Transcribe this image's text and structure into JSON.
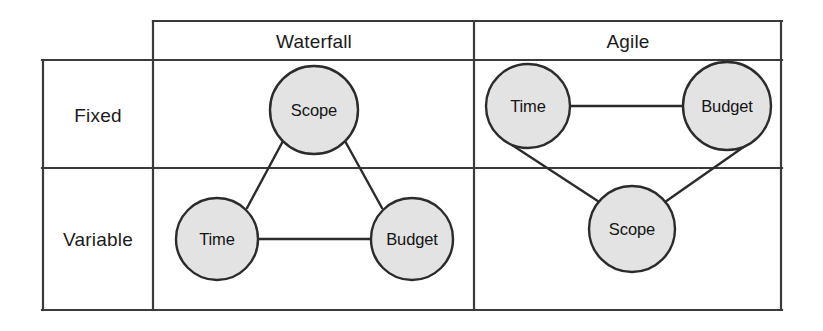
{
  "figure": {
    "name": "iron-triangle-waterfall-vs-agile-matrix",
    "type": "2x2-comparison-matrix-with-node-graphs"
  },
  "matrix": {
    "corner_cell": "",
    "column_headers": [
      {
        "id": "waterfall",
        "label": "Waterfall"
      },
      {
        "id": "agile",
        "label": "Agile"
      }
    ],
    "row_headers": [
      {
        "id": "fixed",
        "label": "Fixed"
      },
      {
        "id": "variable",
        "label": "Variable"
      }
    ]
  },
  "panels": [
    {
      "id": "waterfall",
      "header": "Waterfall",
      "fixed_nodes": [
        "Scope"
      ],
      "variable_nodes": [
        "Time",
        "Budget"
      ],
      "nodes": [
        {
          "id": "wf-scope",
          "label": "Scope",
          "row": "Fixed",
          "cx": 314,
          "cy": 110,
          "r": 44
        },
        {
          "id": "wf-time",
          "label": "Time",
          "row": "Variable",
          "cx": 217,
          "cy": 239,
          "r": 41
        },
        {
          "id": "wf-budget",
          "label": "Budget",
          "row": "Variable",
          "cx": 412,
          "cy": 239,
          "r": 41
        }
      ],
      "edges": [
        {
          "from": "wf-scope",
          "to": "wf-time"
        },
        {
          "from": "wf-scope",
          "to": "wf-budget"
        },
        {
          "from": "wf-time",
          "to": "wf-budget"
        }
      ]
    },
    {
      "id": "agile",
      "header": "Agile",
      "fixed_nodes": [
        "Time",
        "Budget"
      ],
      "variable_nodes": [
        "Scope"
      ],
      "nodes": [
        {
          "id": "ag-time",
          "label": "Time",
          "row": "Fixed",
          "cx": 528,
          "cy": 106,
          "r": 42
        },
        {
          "id": "ag-budget",
          "label": "Budget",
          "row": "Fixed",
          "cx": 727,
          "cy": 106,
          "r": 44
        },
        {
          "id": "ag-scope",
          "label": "Scope",
          "row": "Variable",
          "cx": 632,
          "cy": 229,
          "r": 43
        }
      ],
      "edges": [
        {
          "from": "ag-time",
          "to": "ag-budget"
        },
        {
          "from": "ag-time",
          "to": "ag-scope"
        },
        {
          "from": "ag-budget",
          "to": "ag-scope"
        }
      ]
    }
  ],
  "geometry": {
    "grid": {
      "left": 42,
      "right": 782,
      "top_outer": 20,
      "header_bottom": 60,
      "row_divider": 168,
      "bottom": 310,
      "col_divider": 474,
      "body_left": 153
    }
  },
  "style": {
    "node_fill": "#e3e3e3",
    "node_stroke": "#2b2b2b",
    "line_color": "#2b2b2b",
    "grid_color": "#3a3a3a",
    "text_color": "#1b1b1b",
    "background": "#ffffff"
  }
}
